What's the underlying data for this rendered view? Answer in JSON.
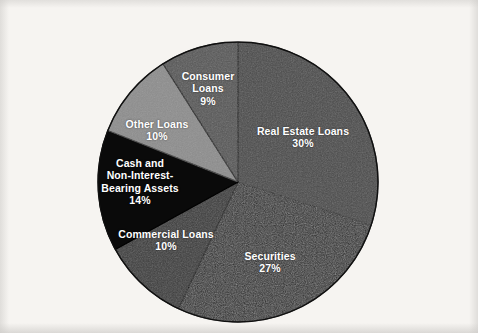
{
  "figure": {
    "background_color": "#f6f4f1",
    "label_text_color": "#ffffff"
  },
  "chart_data": {
    "type": "pie",
    "title": "",
    "subtitle": "",
    "xlabel": "",
    "ylabel": "",
    "legend_position": "none",
    "grid": false,
    "labels_inside_slices": true,
    "start_angle_deg": 0,
    "direction": "clockwise",
    "total": 100,
    "unit": "%",
    "categories": [
      "Real Estate Loans",
      "Securities",
      "Commercial Loans",
      "Cash and Non-Interest-Bearing Assets",
      "Other Loans",
      "Consumer Loans"
    ],
    "values": [
      30,
      27,
      10,
      14,
      10,
      9
    ],
    "colors": [
      "#4a4a4a",
      "#2b2b2b",
      "#3b3b3b",
      "#0a0a0a",
      "#8d8d8d",
      "#575757"
    ],
    "slices": [
      {
        "name": "Real Estate Loans",
        "value": 30,
        "value_label": "30%",
        "color": "#4a4a4a",
        "label_lines": [
          "Real Estate Loans",
          "30%"
        ]
      },
      {
        "name": "Securities",
        "value": 27,
        "value_label": "27%",
        "color": "#2b2b2b",
        "label_lines": [
          "Securities",
          "27%"
        ]
      },
      {
        "name": "Commercial Loans",
        "value": 10,
        "value_label": "10%",
        "color": "#3b3b3b",
        "label_lines": [
          "Commercial Loans",
          "10%"
        ]
      },
      {
        "name": "Cash and Non-Interest-Bearing Assets",
        "value": 14,
        "value_label": "14%",
        "color": "#0a0a0a",
        "label_lines": [
          "Cash and",
          "Non-Interest-",
          "Bearing Assets",
          "14%"
        ]
      },
      {
        "name": "Other Loans",
        "value": 10,
        "value_label": "10%",
        "color": "#8d8d8d",
        "label_lines": [
          "Other Loans",
          "10%"
        ]
      },
      {
        "name": "Consumer Loans",
        "value": 9,
        "value_label": "9%",
        "color": "#575757",
        "label_lines": [
          "Consumer",
          "Loans",
          "9%"
        ]
      }
    ]
  },
  "labels": {
    "real_estate": {
      "line1": "Real Estate Loans",
      "pct": "30%"
    },
    "securities": {
      "line1": "Securities",
      "pct": "27%"
    },
    "commercial": {
      "line1": "Commercial Loans",
      "pct": "10%"
    },
    "cash": {
      "line1": "Cash and",
      "line2": "Non-Interest-",
      "line3": "Bearing Assets",
      "pct": "14%"
    },
    "other_loans": {
      "line1": "Other Loans",
      "pct": "10%"
    },
    "consumer": {
      "line1": "Consumer",
      "line2": "Loans",
      "pct": "9%"
    }
  }
}
